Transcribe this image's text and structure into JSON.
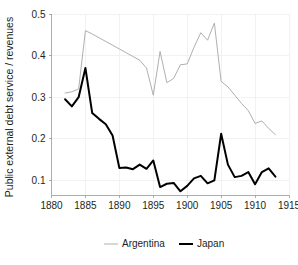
{
  "chart_data": {
    "type": "line",
    "title": "",
    "subtitle": "",
    "xlabel": "",
    "ylabel": "Public external debt service / revenues",
    "xlim": [
      1880,
      1915
    ],
    "ylim": [
      0.065,
      0.5
    ],
    "grid": true,
    "grid_axis": "both",
    "legend_position": "bottom-center",
    "x_ticks": [
      1880,
      1885,
      1890,
      1895,
      1900,
      1905,
      1910,
      1915
    ],
    "x_tick_labels": [
      "1880",
      "1885",
      "1890",
      "1895",
      "1900",
      "1905",
      "1910",
      "1915"
    ],
    "y_ticks": [
      0.1,
      0.2,
      0.3,
      0.4,
      0.5
    ],
    "y_tick_labels": [
      "0.1",
      "0.2",
      "0.3",
      "0.4",
      "0.5"
    ],
    "series": [
      {
        "name": "Argentina",
        "color": "#a6a6a6",
        "line_width": 0.9,
        "x": [
          1882,
          1883,
          1884,
          1885,
          1886,
          1887,
          1888,
          1889,
          1890,
          1891,
          1892,
          1893,
          1894,
          1895,
          1896,
          1897,
          1898,
          1899,
          1900,
          1901,
          1902,
          1903,
          1904,
          1905,
          1906,
          1907,
          1908,
          1909,
          1910,
          1911,
          1912,
          1913
        ],
        "values": [
          0.31,
          0.313,
          0.32,
          0.46,
          0.452,
          0.443,
          0.434,
          0.425,
          0.416,
          0.407,
          0.398,
          0.389,
          0.37,
          0.305,
          0.41,
          0.335,
          0.345,
          0.378,
          0.38,
          0.42,
          0.455,
          0.437,
          0.478,
          0.338,
          0.325,
          0.305,
          0.285,
          0.268,
          0.237,
          0.243,
          0.225,
          0.21
        ]
      },
      {
        "name": "Japan",
        "color": "#000000",
        "line_width": 2.0,
        "x": [
          1882,
          1883,
          1884,
          1885,
          1886,
          1887,
          1888,
          1889,
          1890,
          1891,
          1892,
          1893,
          1894,
          1895,
          1896,
          1897,
          1898,
          1899,
          1900,
          1901,
          1902,
          1903,
          1904,
          1905,
          1906,
          1907,
          1908,
          1909,
          1910,
          1911,
          1912,
          1913
        ],
        "values": [
          0.295,
          0.278,
          0.3,
          0.37,
          0.262,
          0.248,
          0.235,
          0.208,
          0.13,
          0.131,
          0.127,
          0.138,
          0.128,
          0.148,
          0.084,
          0.092,
          0.094,
          0.074,
          0.087,
          0.105,
          0.111,
          0.093,
          0.1,
          0.212,
          0.138,
          0.108,
          0.111,
          0.12,
          0.091,
          0.12,
          0.129,
          0.109
        ]
      }
    ]
  },
  "legend": {
    "entries": [
      {
        "label": "Argentina"
      },
      {
        "label": "Japan"
      }
    ]
  }
}
